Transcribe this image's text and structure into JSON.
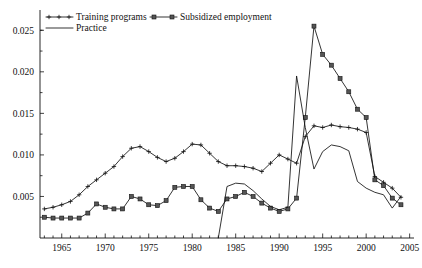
{
  "chart_data": {
    "type": "line",
    "title": "",
    "subtitle": "",
    "xlabel": "",
    "ylabel": "",
    "xlim": [
      1962.5,
      2005.5
    ],
    "ylim": [
      0,
      0.0272
    ],
    "grid": false,
    "legend_position": "top-left",
    "x_ticks": [
      "1965",
      "1970",
      "1975",
      "1980",
      "1985",
      "1990",
      "1995",
      "2000",
      "2005"
    ],
    "x_tick_values": [
      1965,
      1970,
      1975,
      1980,
      1985,
      1990,
      1995,
      2000,
      2005
    ],
    "y_ticks": [
      "0.005",
      "0.010",
      "0.015",
      "0.020",
      "0.025"
    ],
    "y_tick_values": [
      0.005,
      0.01,
      0.015,
      0.02,
      0.025
    ],
    "series": [
      {
        "name": "Training programs",
        "marker": "plus",
        "x": [
          1963,
          1964,
          1965,
          1966,
          1967,
          1968,
          1969,
          1970,
          1971,
          1972,
          1973,
          1974,
          1975,
          1976,
          1977,
          1978,
          1979,
          1980,
          1981,
          1982,
          1983,
          1984,
          1985,
          1986,
          1987,
          1988,
          1989,
          1990,
          1991,
          1992,
          1993,
          1994,
          1995,
          1996,
          1997,
          1998,
          1999,
          2000,
          2001,
          2002,
          2003,
          2004
        ],
        "values": [
          0.0035,
          0.0037,
          0.004,
          0.0044,
          0.0052,
          0.0062,
          0.007,
          0.0078,
          0.0086,
          0.0098,
          0.0108,
          0.011,
          0.0104,
          0.0097,
          0.0092,
          0.0096,
          0.0104,
          0.0113,
          0.0112,
          0.0102,
          0.0092,
          0.0087,
          0.0087,
          0.0086,
          0.0084,
          0.008,
          0.009,
          0.01,
          0.0095,
          0.009,
          0.0122,
          0.0135,
          0.0133,
          0.0136,
          0.0134,
          0.0133,
          0.0131,
          0.0127,
          0.0074,
          0.0067,
          0.006,
          0.0049
        ]
      },
      {
        "name": "Subsidized employment",
        "marker": "square",
        "x": [
          1963,
          1964,
          1965,
          1966,
          1967,
          1968,
          1969,
          1970,
          1971,
          1972,
          1973,
          1974,
          1975,
          1976,
          1977,
          1978,
          1979,
          1980,
          1981,
          1982,
          1983,
          1984,
          1985,
          1986,
          1987,
          1988,
          1989,
          1990,
          1991,
          1992,
          1993,
          1994,
          1995,
          1996,
          1997,
          1998,
          1999,
          2000,
          2001,
          2002,
          2003,
          2004
        ],
        "values": [
          0.0025,
          0.0024,
          0.0024,
          0.0024,
          0.0024,
          0.003,
          0.0041,
          0.0037,
          0.0035,
          0.0035,
          0.005,
          0.0047,
          0.004,
          0.0039,
          0.0045,
          0.0061,
          0.0062,
          0.0062,
          0.0046,
          0.0036,
          0.0032,
          0.0047,
          0.005,
          0.0055,
          0.005,
          0.0042,
          0.0036,
          0.0032,
          0.0035,
          0.0048,
          0.0145,
          0.0255,
          0.0221,
          0.0208,
          0.0192,
          0.0176,
          0.0155,
          0.0145,
          0.007,
          0.0063,
          0.0048,
          0.004
        ]
      },
      {
        "name": "Practice",
        "marker": "none",
        "x": [
          1983,
          1984,
          1985,
          1986,
          1987,
          1988,
          1989,
          1990,
          1991,
          1992,
          1993,
          1994,
          1995,
          1996,
          1997,
          1998,
          1999,
          2000,
          2001,
          2002,
          2003,
          2004
        ],
        "values": [
          0.0,
          0.0062,
          0.0066,
          0.0065,
          0.0057,
          0.0047,
          0.0038,
          0.0034,
          0.0037,
          0.0195,
          0.0133,
          0.0083,
          0.0104,
          0.0112,
          0.011,
          0.0105,
          0.0068,
          0.006,
          0.0055,
          0.0052,
          0.0036,
          0.005
        ]
      }
    ]
  },
  "legend": {
    "items": [
      {
        "label": "Training programs",
        "marker": "plus"
      },
      {
        "label": "Subsidized employment",
        "marker": "square"
      },
      {
        "label": "Practice",
        "marker": "line"
      }
    ]
  }
}
